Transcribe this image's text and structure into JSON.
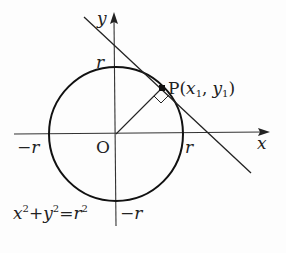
{
  "diagram": {
    "type": "circle-tangent",
    "axes": {
      "x_label": "x",
      "y_label": "y",
      "origin_label": "O"
    },
    "circle": {
      "equation_parts": {
        "x": "x",
        "y": "y",
        "r": "r",
        "exp": "2",
        "plus": "+",
        "eq": "="
      }
    },
    "point": {
      "name": "P",
      "open": "(",
      "x": "x",
      "x_sub": "1",
      "comma": ",",
      "y": "y",
      "y_sub": "1",
      "close": ")"
    },
    "ticks": {
      "pos_x": "r",
      "neg_x": "−r",
      "pos_y": "r",
      "neg_y": "−r"
    },
    "colors": {
      "stroke": "#1a1a1a",
      "background": "#fdfdfd"
    }
  }
}
